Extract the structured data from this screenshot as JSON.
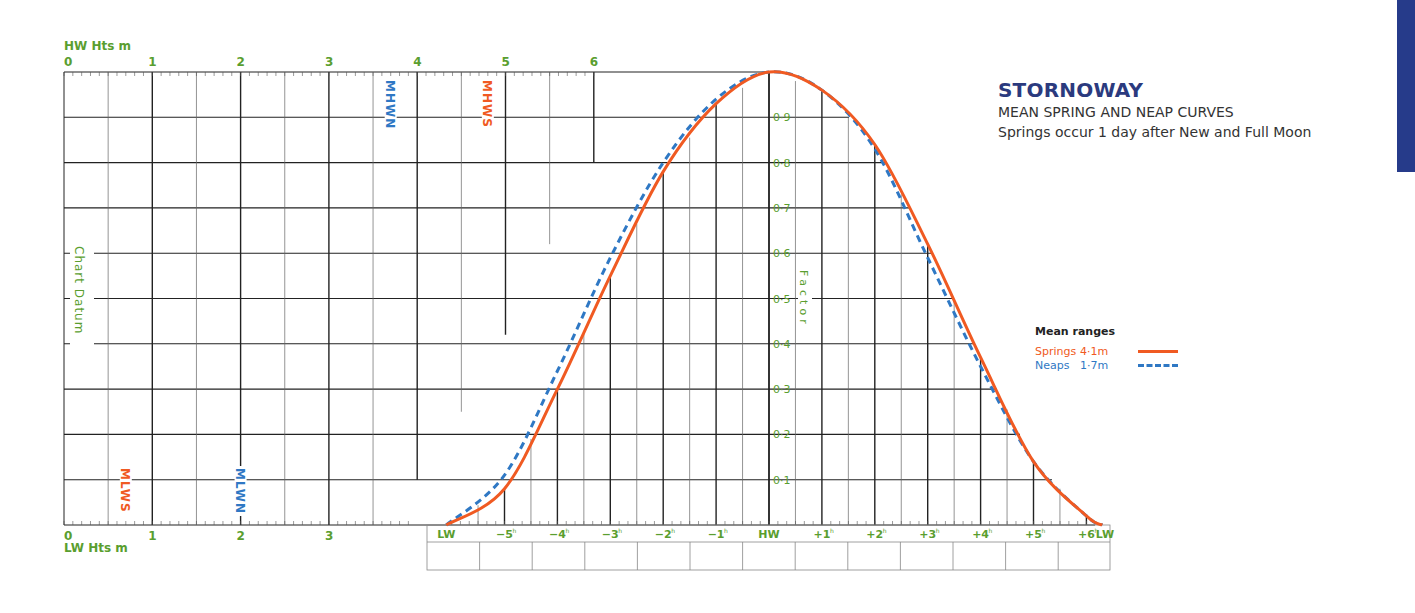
{
  "header": {
    "title": "STORNOWAY",
    "subtitle": "MEAN SPRING AND NEAP CURVES",
    "note": "Springs occur 1 day after New and Full Moon"
  },
  "axes": {
    "hw_label": "HW Hts m",
    "lw_label": "LW Hts m",
    "hw_ticks": [
      "0",
      "1",
      "2",
      "3",
      "4",
      "5",
      "6"
    ],
    "lw_ticks": [
      "0",
      "1",
      "2",
      "3"
    ],
    "datum_label": "Chart Datum",
    "factor_label": "Factor",
    "factor_ticks": [
      "0·1",
      "0·2",
      "0·3",
      "0·4",
      "0·5",
      "0·6",
      "0·7",
      "0·8",
      "0·9"
    ],
    "time_ticks": [
      "LW",
      "−5h",
      "−4h",
      "−3h",
      "−2h",
      "−1h",
      "HW",
      "+1h",
      "+2h",
      "+3h",
      "+4h",
      "+5h",
      "+6h",
      "LW"
    ]
  },
  "markers": {
    "mhwn": "MHWN",
    "mhws": "MHWS",
    "mlws": "MLWS",
    "mlwn": "MLWN"
  },
  "legend": {
    "title": "Mean ranges",
    "springs_label": "Springs",
    "springs_value": "4·1m",
    "neaps_label": "Neaps",
    "neaps_value": "1·7m"
  },
  "colors": {
    "springs": "#f05a22",
    "neaps": "#2f78c4",
    "axis_text": "#5a9e2f",
    "title": "#2b3a7e",
    "tab": "#263b8a"
  },
  "chart_data": {
    "type": "line",
    "xlabel": "Hours relative to HW",
    "ylabel": "Factor",
    "ylim": [
      0,
      1
    ],
    "grid": true,
    "legend_position": "right",
    "categories": [
      "LW",
      "-5h",
      "-4h",
      "-3h",
      "-2h",
      "-1h",
      "HW",
      "+1h",
      "+2h",
      "+3h",
      "+4h",
      "+5h",
      "+6h",
      "LW"
    ],
    "x": [
      -6.1,
      -5,
      -4,
      -3,
      -2,
      -1,
      0,
      1,
      2,
      3,
      4,
      5,
      6,
      6.3
    ],
    "series": [
      {
        "name": "Springs 4·1m",
        "style": "solid",
        "values": [
          0.0,
          0.08,
          0.3,
          0.55,
          0.78,
          0.93,
          1.0,
          0.96,
          0.84,
          0.62,
          0.37,
          0.14,
          0.02,
          0.0
        ]
      },
      {
        "name": "Neaps 1·7m",
        "style": "dashed",
        "values": [
          0.0,
          0.11,
          0.34,
          0.59,
          0.8,
          0.94,
          1.0,
          0.96,
          0.83,
          0.59,
          0.35,
          0.14,
          0.02,
          0.0
        ]
      }
    ],
    "height_markers_m": {
      "MHWS": 4.8,
      "MHWN": 3.7,
      "MLWN": 2.0,
      "MLWS": 0.7
    }
  }
}
